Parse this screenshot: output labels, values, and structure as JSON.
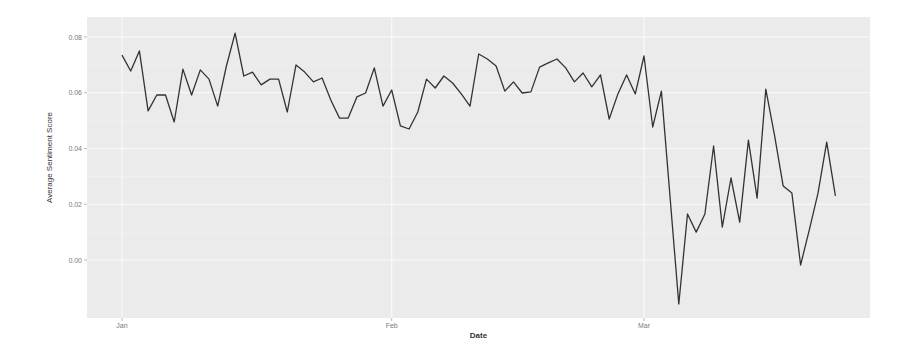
{
  "chart_data": {
    "type": "line",
    "title": "",
    "xlabel": "Date",
    "ylabel": "Average Sentiment Score",
    "ylim": [
      -0.022,
      0.084
    ],
    "y_ticks": [
      {
        "value": 0.0,
        "label": "0.00"
      },
      {
        "value": 0.02,
        "label": "0.02"
      },
      {
        "value": 0.04,
        "label": "0.04"
      },
      {
        "value": 0.06,
        "label": "0.06"
      },
      {
        "value": 0.08,
        "label": "0.08"
      }
    ],
    "x_ticks": [
      {
        "day": 0,
        "label": "Jan"
      },
      {
        "day": 31,
        "label": "Feb"
      },
      {
        "day": 60,
        "label": "Mar"
      }
    ],
    "grid": true,
    "legend": null,
    "background": "#ebebeb",
    "line_color": "#333333",
    "series": [
      {
        "name": "Average Sentiment Score",
        "x_day": [
          0,
          1,
          2,
          3,
          4,
          5,
          6,
          7,
          8,
          9,
          10,
          11,
          12,
          13,
          14,
          15,
          16,
          17,
          18,
          19,
          20,
          21,
          22,
          23,
          24,
          25,
          26,
          27,
          28,
          29,
          30,
          31,
          32,
          33,
          34,
          35,
          36,
          37,
          38,
          39,
          40,
          41,
          42,
          43,
          44,
          45,
          46,
          47,
          48,
          49,
          50,
          51,
          52,
          53,
          54,
          55,
          56,
          57,
          58,
          59,
          60,
          61,
          62,
          64,
          65,
          66,
          67,
          68,
          69,
          70,
          71,
          72,
          73,
          74,
          75,
          76,
          77,
          78,
          79,
          80,
          81,
          82
        ],
        "values": [
          0.0735,
          0.0678,
          0.075,
          0.0535,
          0.0592,
          0.0592,
          0.0495,
          0.0685,
          0.0592,
          0.0682,
          0.0649,
          0.0552,
          0.0696,
          0.0814,
          0.066,
          0.0674,
          0.0628,
          0.0649,
          0.0649,
          0.0531,
          0.07,
          0.0674,
          0.0639,
          0.0653,
          0.0574,
          0.0509,
          0.0509,
          0.0585,
          0.0599,
          0.0689,
          0.0552,
          0.061,
          0.0481,
          0.047,
          0.0531,
          0.0649,
          0.0617,
          0.066,
          0.0635,
          0.0596,
          0.0552,
          0.0739,
          0.0721,
          0.0696,
          0.0606,
          0.0639,
          0.0599,
          0.0603,
          0.0692,
          0.0707,
          0.0721,
          0.0689,
          0.0639,
          0.0671,
          0.0621,
          0.0664,
          0.0506,
          0.0596,
          0.0664,
          0.0596,
          0.0732,
          0.0477,
          0.0606,
          -0.0158,
          0.0165,
          0.01,
          0.0165,
          0.0409,
          0.0118,
          0.0294,
          0.0136,
          0.043,
          0.0222,
          0.0613,
          0.0448,
          0.0265,
          0.024,
          -0.0018,
          0.0108,
          0.024,
          0.0423,
          0.023
        ]
      }
    ]
  },
  "layout": {
    "panel": {
      "left": 87,
      "top": 17,
      "right": 870,
      "bottom": 318
    },
    "y_zero_px": 260,
    "px_per_unit": 2787.5,
    "x_day0_px": 122,
    "px_per_day": 8.7
  }
}
